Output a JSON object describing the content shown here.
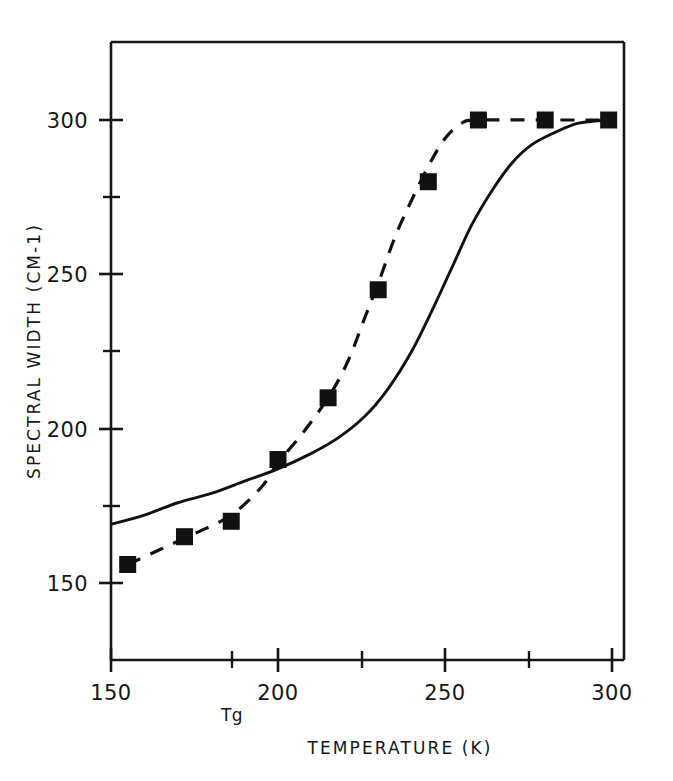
{
  "chart_data": {
    "type": "scatter",
    "title": "",
    "xlabel": "TEMPERATURE  (K)",
    "ylabel": "SPECTRAL WIDTH  (CM-1)",
    "xlim": [
      150,
      300
    ],
    "ylim": [
      137,
      315
    ],
    "xticks": [
      150,
      200,
      250,
      300
    ],
    "xtick_labels": [
      "150",
      "200",
      "250",
      "300"
    ],
    "yticks": [
      150,
      200,
      250,
      300
    ],
    "ytick_labels": [
      "150",
      "200",
      "250",
      "300"
    ],
    "x_minor_ticks": [
      186,
      225,
      275
    ],
    "y_minor_ticks": [
      175,
      225,
      275
    ],
    "grid": false,
    "legend": null,
    "annotations": [
      {
        "text": "Tg",
        "x": 186,
        "y": 141,
        "note": "glass transition temperature marker on x-axis"
      }
    ],
    "series": [
      {
        "name": "measured spectral width",
        "type": "scatter",
        "marker": "filled-square",
        "color": "#111111",
        "points": [
          {
            "x": 155,
            "y": 156
          },
          {
            "x": 172,
            "y": 165
          },
          {
            "x": 186,
            "y": 170
          },
          {
            "x": 200,
            "y": 190
          },
          {
            "x": 215,
            "y": 210
          },
          {
            "x": 230,
            "y": 245
          },
          {
            "x": 245,
            "y": 280
          },
          {
            "x": 260,
            "y": 300
          },
          {
            "x": 280,
            "y": 300
          },
          {
            "x": 299,
            "y": 300
          }
        ]
      },
      {
        "name": "dashed fit through data",
        "type": "line",
        "style": "dashed",
        "color": "#111111",
        "points": [
          {
            "x": 155,
            "y": 156
          },
          {
            "x": 165,
            "y": 161
          },
          {
            "x": 175,
            "y": 166
          },
          {
            "x": 186,
            "y": 172
          },
          {
            "x": 195,
            "y": 181
          },
          {
            "x": 200,
            "y": 189
          },
          {
            "x": 207,
            "y": 198
          },
          {
            "x": 215,
            "y": 210
          },
          {
            "x": 221,
            "y": 222
          },
          {
            "x": 226,
            "y": 236
          },
          {
            "x": 230,
            "y": 247
          },
          {
            "x": 235,
            "y": 262
          },
          {
            "x": 240,
            "y": 274
          },
          {
            "x": 245,
            "y": 285
          },
          {
            "x": 250,
            "y": 294
          },
          {
            "x": 255,
            "y": 299
          },
          {
            "x": 260,
            "y": 300
          },
          {
            "x": 280,
            "y": 300
          },
          {
            "x": 299,
            "y": 300
          }
        ]
      },
      {
        "name": "solid model curve",
        "type": "line",
        "style": "solid",
        "color": "#111111",
        "points": [
          {
            "x": 150,
            "y": 169
          },
          {
            "x": 160,
            "y": 172
          },
          {
            "x": 170,
            "y": 176
          },
          {
            "x": 180,
            "y": 179
          },
          {
            "x": 190,
            "y": 183
          },
          {
            "x": 200,
            "y": 187
          },
          {
            "x": 210,
            "y": 192
          },
          {
            "x": 218,
            "y": 197
          },
          {
            "x": 226,
            "y": 204
          },
          {
            "x": 233,
            "y": 213
          },
          {
            "x": 240,
            "y": 225
          },
          {
            "x": 246,
            "y": 238
          },
          {
            "x": 252,
            "y": 252
          },
          {
            "x": 258,
            "y": 266
          },
          {
            "x": 264,
            "y": 277
          },
          {
            "x": 270,
            "y": 286
          },
          {
            "x": 276,
            "y": 292
          },
          {
            "x": 283,
            "y": 296
          },
          {
            "x": 290,
            "y": 299
          },
          {
            "x": 299,
            "y": 300
          }
        ]
      }
    ]
  },
  "axes": {
    "x_title": "TEMPERATURE  (K)",
    "y_title": "SPECTRAL WIDTH  (CM-1)",
    "x_tick_labels": [
      "150",
      "200",
      "250",
      "300"
    ],
    "y_tick_labels": [
      "300",
      "250",
      "200",
      "150"
    ],
    "tg_marker_label": "Tg"
  },
  "style": {
    "ink": "#161616",
    "background": "#ffffff"
  }
}
